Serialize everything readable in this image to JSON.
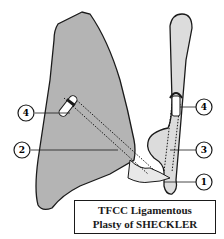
{
  "colors": {
    "radius_fill": "#b4b4b4",
    "ulna_fill": "#dcdcdc",
    "outline": "#1a1a1a",
    "background": "#ffffff"
  },
  "callouts": [
    {
      "id": "callout-1",
      "label": "1"
    },
    {
      "id": "callout-2",
      "label": "2"
    },
    {
      "id": "callout-3",
      "label": "3"
    },
    {
      "id": "callout-4-left",
      "label": "4"
    },
    {
      "id": "callout-4-right",
      "label": "4"
    }
  ],
  "caption": {
    "line1": "TFCC Ligamentous",
    "line2": "Plasty of SHECKLER"
  }
}
